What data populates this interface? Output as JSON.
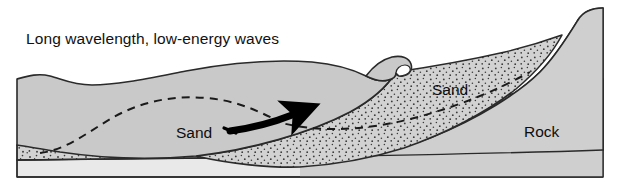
{
  "figure": {
    "title": "Long wavelength, low-energy waves",
    "width": 620,
    "height": 190,
    "background": "#ffffff"
  },
  "labels": {
    "sand_lower": "Sand",
    "sand_upper": "Sand",
    "rock": "Rock"
  },
  "colors": {
    "water_fill": "#c9c9c9",
    "sand_fill": "#d2d2d2",
    "rock_fill": "#cfcfcf",
    "basement_fill": "#e9e9e9",
    "stipple_dot": "#3a3a3a",
    "outline": "#2a2a2a",
    "text": "#0d0d0d",
    "arrow": "#000000",
    "dashed_profile": "#1a1a1a"
  },
  "elements": {
    "water_body_name": "water-body",
    "wave_crest_name": "breaking-wave-crest",
    "sand_wedge_name": "sand-wedge-deposit",
    "rock_cliff_name": "rock-cliff",
    "seabed_sand_name": "seabed-sand-layer",
    "basement_name": "basement-layer",
    "dashed_former_profile_name": "former-profile-dashed-line",
    "transport_arrow_name": "onshore-sand-transport-arrow"
  }
}
